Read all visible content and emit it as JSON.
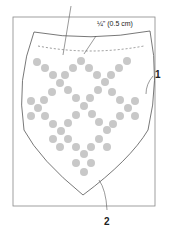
{
  "labels": {
    "seam_allowance": "¼\" (0.5 cm)",
    "callout_1": "1",
    "callout_2": "2"
  },
  "colors": {
    "dots": "#c8c8c8",
    "lines": "#555555",
    "frame": "#888888"
  }
}
